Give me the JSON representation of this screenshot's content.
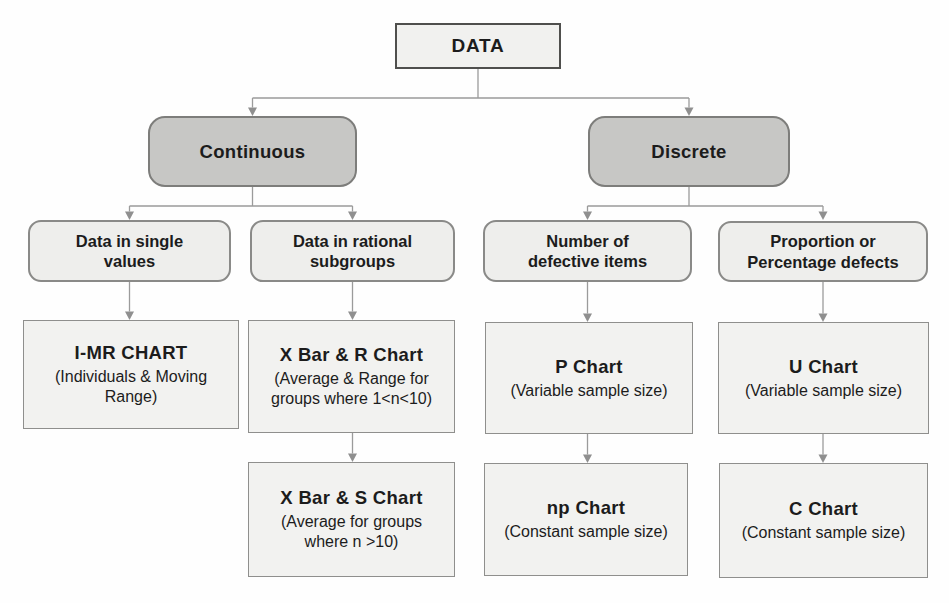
{
  "nodes": {
    "data": {
      "label": "DATA"
    },
    "continuous": {
      "label": "Continuous"
    },
    "discrete": {
      "label": "Discrete"
    },
    "single_values": {
      "label": "Data in single values"
    },
    "rational_subgroups": {
      "label": "Data in rational subgroups"
    },
    "defective_items": {
      "label": "Number of defective items"
    },
    "percentage_defects": {
      "label": "Proportion or Percentage defects"
    },
    "imr_chart": {
      "title": "I-MR CHART",
      "subtitle": "(Individuals & Moving Range)"
    },
    "xbar_r_chart": {
      "title": "X Bar & R Chart",
      "subtitle": "(Average & Range for groups where 1<n<10)"
    },
    "xbar_s_chart": {
      "title": "X Bar & S Chart",
      "subtitle": "(Average for groups where n >10)"
    },
    "p_chart": {
      "title": "P Chart",
      "subtitle": "(Variable sample size)"
    },
    "np_chart": {
      "title": "np Chart",
      "subtitle": "(Constant sample size)"
    },
    "u_chart": {
      "title": "U Chart",
      "subtitle": "(Variable sample size)"
    },
    "c_chart": {
      "title": "C Chart",
      "subtitle": "(Constant sample size)"
    }
  },
  "edges": [
    [
      "data",
      "continuous"
    ],
    [
      "data",
      "discrete"
    ],
    [
      "continuous",
      "single_values"
    ],
    [
      "continuous",
      "rational_subgroups"
    ],
    [
      "discrete",
      "defective_items"
    ],
    [
      "discrete",
      "percentage_defects"
    ],
    [
      "single_values",
      "imr_chart"
    ],
    [
      "rational_subgroups",
      "xbar_r_chart"
    ],
    [
      "defective_items",
      "p_chart"
    ],
    [
      "percentage_defects",
      "u_chart"
    ],
    [
      "xbar_r_chart",
      "xbar_s_chart"
    ],
    [
      "p_chart",
      "np_chart"
    ],
    [
      "u_chart",
      "c_chart"
    ]
  ],
  "colors": {
    "background": "#fefefe",
    "branch_fill": "#c7c7c5",
    "category_fill": "#eeeeec",
    "chart_fill": "#f2f2f0",
    "root_border": "#4f4f4d",
    "box_border": "#8a8a88",
    "connector": "#9b9b9b",
    "text": "#1c1c1c"
  }
}
